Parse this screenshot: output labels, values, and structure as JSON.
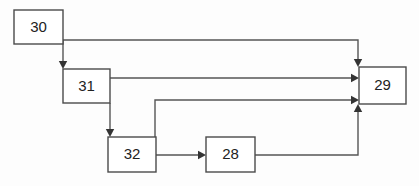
{
  "diagram": {
    "background_color": "#fdfdfd",
    "line_color": "#555555",
    "box_stroke_color": "#4a4a4a",
    "box_fill_color": "#ffffff",
    "text_color": "#222222",
    "nodes": [
      {
        "id": "n30",
        "label": "30",
        "x": 14,
        "y": 10,
        "w": 49,
        "h": 34,
        "cx": 38.5,
        "cy": 27
      },
      {
        "id": "n31",
        "label": "31",
        "x": 63,
        "y": 69,
        "w": 47,
        "h": 34,
        "cx": 86.5,
        "cy": 86
      },
      {
        "id": "n32",
        "label": "32",
        "x": 108,
        "y": 137,
        "w": 48,
        "h": 35,
        "cx": 132,
        "cy": 154.5
      },
      {
        "id": "n28",
        "label": "28",
        "x": 206,
        "y": 137,
        "w": 49,
        "h": 35,
        "cx": 230.5,
        "cy": 154.5
      },
      {
        "id": "n29",
        "label": "29",
        "x": 359,
        "y": 67,
        "w": 47,
        "h": 37,
        "cx": 382.5,
        "cy": 85.5
      }
    ],
    "edges": [
      {
        "id": "e30-31",
        "from": "30",
        "to": "31",
        "path": "M 63 40 L 63 63",
        "arrow": {
          "x": 63,
          "y": 69,
          "dir": "down"
        }
      },
      {
        "id": "e30-29",
        "from": "30",
        "to": "29",
        "path": "M 63 40 L 358 40 L 358 61",
        "arrow": {
          "x": 358,
          "y": 67,
          "dir": "down"
        }
      },
      {
        "id": "e31-29-upper",
        "from": "31",
        "to": "29",
        "path": "M 110 78 L 353 78",
        "arrow": {
          "x": 359,
          "y": 78,
          "dir": "right"
        }
      },
      {
        "id": "e31-32",
        "from": "31",
        "to": "32",
        "path": "M 110 103 L 110 131",
        "arrow": {
          "x": 110,
          "y": 137,
          "dir": "down"
        }
      },
      {
        "id": "e32-29-lower",
        "from": "32",
        "to": "29",
        "path": "M 155 137 L 155 100 L 353 100",
        "arrow": {
          "x": 359,
          "y": 100,
          "dir": "right"
        }
      },
      {
        "id": "e32-28",
        "from": "32",
        "to": "28",
        "path": "M 156 155 L 200 155",
        "arrow": {
          "x": 206,
          "y": 155,
          "dir": "right"
        }
      },
      {
        "id": "e28-29",
        "from": "28",
        "to": "29",
        "path": "M 255 155 L 358 155 L 358 110",
        "arrow": {
          "x": 358,
          "y": 104,
          "dir": "up"
        }
      }
    ]
  }
}
